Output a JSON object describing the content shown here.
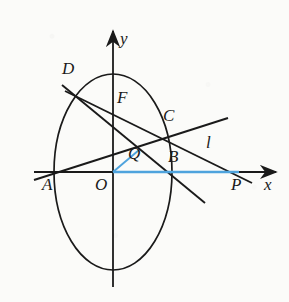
{
  "figure": {
    "colors": {
      "ink": "#1a1a1a",
      "accent_blue": "#4ea3dd",
      "paper": "#fbfbf9"
    },
    "axes": {
      "x_label": "x",
      "y_label": "y",
      "origin_label": "O",
      "x_axis": {
        "x1": 34,
        "y1": 172,
        "x2": 280,
        "y2": 172
      },
      "y_axis": {
        "x1": 113,
        "y1": 287,
        "x2": 113,
        "y2": 26
      }
    },
    "ellipse": {
      "cx": 113,
      "cy": 172,
      "rx": 59,
      "ry": 98
    },
    "points": [
      {
        "name": "A",
        "x": 53,
        "y": 172,
        "label_x": 44,
        "label_y": 178
      },
      {
        "name": "O",
        "x": 113,
        "y": 172,
        "label_x": 97,
        "label_y": 178
      },
      {
        "name": "B",
        "x": 171,
        "y": 172,
        "label_x": 170,
        "label_y": 152
      },
      {
        "name": "P",
        "x": 238,
        "y": 172,
        "label_x": 232,
        "label_y": 178
      },
      {
        "name": "C",
        "x": 164,
        "y": 134,
        "label_x": 165,
        "label_y": 110
      },
      {
        "name": "D",
        "x": 78,
        "y": 95,
        "label_x": 64,
        "label_y": 63
      },
      {
        "name": "F",
        "x": 113,
        "y": 108,
        "label_x": 119,
        "label_y": 90
      },
      {
        "name": "Q",
        "x": 137,
        "y": 152,
        "label_x": 130,
        "label_y": 152
      }
    ],
    "lines": [
      {
        "name": "line-A-C-extended",
        "x1": 34,
        "y1": 180,
        "x2": 228,
        "y2": 118
      },
      {
        "name": "line-D-B-extended",
        "x1": 62,
        "y1": 85,
        "x2": 205,
        "y2": 203
      },
      {
        "name": "line-D-P-tangent-l",
        "x1": 65,
        "y1": 91,
        "x2": 250,
        "y2": 182
      },
      {
        "name": "tangent-label",
        "label": "l",
        "label_x": 205,
        "label_y": 140
      }
    ],
    "blue_segments": [
      {
        "name": "segment-O-Q",
        "x1": 113,
        "y1": 172,
        "x2": 138,
        "y2": 151
      },
      {
        "name": "segment-O-P",
        "x1": 113,
        "y1": 172,
        "x2": 238,
        "y2": 172
      }
    ]
  }
}
